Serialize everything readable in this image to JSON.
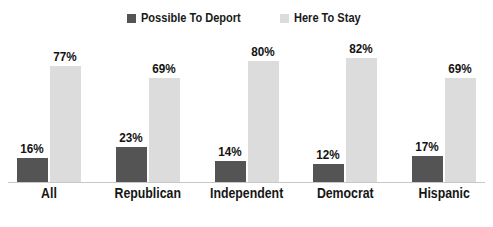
{
  "chart_data": {
    "type": "bar",
    "title": "",
    "subtitle": "",
    "xlabel": "",
    "ylabel": "",
    "ylim": [
      0,
      100
    ],
    "grid": false,
    "legend_position": "top-center",
    "value_suffix": "%",
    "categories": [
      "All",
      "Republican",
      "Independent",
      "Democrat",
      "Hispanic"
    ],
    "series": [
      {
        "name": "Possible To Deport",
        "color": "#545454",
        "values": [
          16,
          23,
          14,
          12,
          17
        ],
        "labels": [
          "16%",
          "23%",
          "14%",
          "12%",
          "17%"
        ]
      },
      {
        "name": "Here To Stay",
        "color": "#dcdcdc",
        "values": [
          77,
          69,
          80,
          82,
          69
        ],
        "labels": [
          "77%",
          "69%",
          "80%",
          "82%",
          "69%"
        ]
      }
    ]
  },
  "legend": {
    "items": [
      {
        "label": "Possible To Deport",
        "color": "#545454"
      },
      {
        "label": "Here To Stay",
        "color": "#dcdcdc"
      }
    ]
  },
  "axis": {
    "baseline_color": "#c8c8c8"
  }
}
